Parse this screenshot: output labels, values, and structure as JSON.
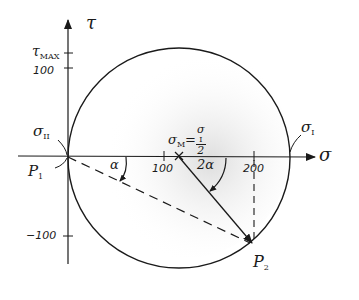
{
  "diagram": {
    "type": "mohr-circle",
    "axes": {
      "x_label": "σ",
      "y_label": "τ",
      "x_ticks": [
        {
          "value": 100,
          "label": "100"
        },
        {
          "value": 200,
          "label": "200"
        }
      ],
      "y_ticks": [
        {
          "value": 100,
          "label": "100"
        },
        {
          "value": -100,
          "label": "−100"
        }
      ],
      "y_special_tick": {
        "label": "τ",
        "subscript": "MAX"
      }
    },
    "circle": {
      "center_label": "σ",
      "center_subscript": "M",
      "center_equals": "=",
      "center_fraction_numerator": "σ",
      "center_fraction_numerator_sub": "I",
      "center_fraction_denominator": "2",
      "left_intersection_label": "σ",
      "left_intersection_subscript": "II",
      "right_intersection_label": "σ",
      "right_intersection_subscript": "I"
    },
    "points": [
      {
        "name": "P",
        "subscript": "1"
      },
      {
        "name": "P",
        "subscript": "2"
      }
    ],
    "angles": [
      {
        "label": "α",
        "description": "angle between σ-axis and dashed line P1–P2"
      },
      {
        "label": "2α",
        "description": "angle at center between σ-axis and radius to P2"
      }
    ],
    "colors": {
      "ink": "#1a1a1a",
      "shading": "#e6e6e6",
      "background": "#ffffff"
    }
  }
}
